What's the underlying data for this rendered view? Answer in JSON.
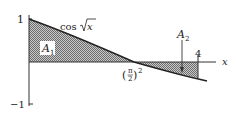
{
  "diagram": {
    "function_label": "cos √x",
    "function_parts": {
      "cos": "cos",
      "arg": "x"
    },
    "y_ticks": [
      {
        "label": "1",
        "value": 1
      },
      {
        "label": "−1",
        "value": -1
      }
    ],
    "x_axis_label": "x",
    "x_marks": [
      {
        "label": "(π/2)²",
        "value": 2.4674
      },
      {
        "label": "4",
        "value": 4
      }
    ],
    "zero_label": {
      "open": "(",
      "num": "π",
      "den": "2",
      "close": ")",
      "exp": "2"
    },
    "regions": [
      {
        "name": "A1",
        "label_main": "A",
        "label_sub": "1",
        "description": "area under cos√x from 0 to (π/2)², above x-axis"
      },
      {
        "name": "A2",
        "label_main": "A",
        "label_sub": "2",
        "description": "area between x-axis and cos√x from (π/2)² to 4, below x-axis"
      }
    ],
    "colors": {
      "line": "#222222",
      "hatch": "#9a9a9a",
      "background": "#ffffff"
    }
  }
}
